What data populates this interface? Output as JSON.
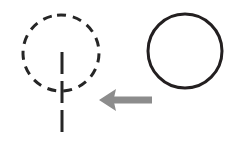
{
  "diagram": {
    "background_color": "#ffffff",
    "width": 234,
    "height": 145,
    "shapes": [
      {
        "id": "dashed-tree-symbol",
        "name": "dashed-circle-with-stem",
        "role": "source-figure",
        "position": "left",
        "stroke_color": "#262626",
        "stroke_width": 3,
        "stroke_style": "dashed",
        "dash_pattern": "9 7",
        "circle": {
          "center_x": 61,
          "center_y": 53,
          "radius": 38
        },
        "stem": {
          "x": 62,
          "y_top": 52,
          "y_bottom": 138,
          "dash_pattern": "22 7"
        },
        "label": ""
      },
      {
        "id": "solid-circle",
        "name": "plain-circle",
        "role": "target-figure",
        "position": "right",
        "stroke_color": "#231f20",
        "stroke_width": 3,
        "stroke_style": "solid",
        "circle": {
          "center_x": 185,
          "center_y": 51,
          "radius_x": 37,
          "radius_y": 37
        },
        "label": ""
      }
    ],
    "arrow": {
      "id": "transformation-arrow",
      "name": "left-pointing-arrow",
      "direction": "left",
      "color": "#8c8c8c",
      "tail_x": 152,
      "tip_x": 99,
      "y": 100,
      "shaft_thickness": 7,
      "head_width": 17,
      "head_height": 22,
      "label": ""
    }
  }
}
